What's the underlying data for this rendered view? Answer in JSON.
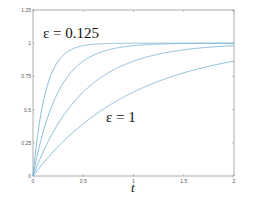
{
  "chart_data": {
    "type": "line",
    "title": "",
    "xlabel": "t",
    "ylabel": "",
    "xlim": [
      0,
      2
    ],
    "ylim": [
      0,
      1.25
    ],
    "grid": false,
    "x_ticks": [
      "0",
      "0.5",
      "1",
      "1.5",
      "2"
    ],
    "y_ticks": [
      "0",
      "0.25",
      "0.5",
      "0.75",
      "1",
      "1.25"
    ],
    "formula": "y = 1 - exp(-t/ε)",
    "series": [
      {
        "name": "ε = 0.125",
        "epsilon": 0.125,
        "x": [
          0,
          0.25,
          0.5,
          0.75,
          1,
          1.5,
          2
        ],
        "values": [
          0,
          0.86,
          0.98,
          1.0,
          1.0,
          1.0,
          1.0
        ]
      },
      {
        "name": "ε = 0.25",
        "epsilon": 0.25,
        "x": [
          0,
          0.25,
          0.5,
          0.75,
          1,
          1.5,
          2
        ],
        "values": [
          0,
          0.63,
          0.86,
          0.95,
          0.98,
          1.0,
          1.0
        ]
      },
      {
        "name": "ε = 0.5",
        "epsilon": 0.5,
        "x": [
          0,
          0.25,
          0.5,
          0.75,
          1,
          1.5,
          2
        ],
        "values": [
          0,
          0.39,
          0.63,
          0.78,
          0.86,
          0.95,
          0.98
        ]
      },
      {
        "name": "ε = 1",
        "epsilon": 1,
        "x": [
          0,
          0.25,
          0.5,
          0.75,
          1,
          1.5,
          2
        ],
        "values": [
          0,
          0.22,
          0.39,
          0.53,
          0.63,
          0.78,
          0.86
        ]
      }
    ],
    "annotations": [
      {
        "text": "ε = 0.125",
        "x": 0.05,
        "y": 1.07
      },
      {
        "text": "ε = 1",
        "x": 0.82,
        "y": 0.43
      }
    ],
    "line_color": "#7fb6d6",
    "axis_color": "#999999"
  }
}
